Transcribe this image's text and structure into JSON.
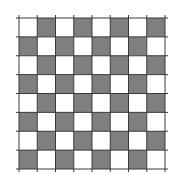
{
  "board": {
    "rows": 8,
    "cols": 8,
    "x0": 19,
    "y0": 18,
    "x1": 165,
    "y1": 169,
    "overhang": 3,
    "colors": {
      "dark": "#7f7f7f",
      "light": "#ffffff",
      "line": "#3a3a3a"
    },
    "pattern": [
      [
        0,
        1,
        0,
        1,
        0,
        1,
        0,
        1
      ],
      [
        1,
        0,
        1,
        0,
        1,
        0,
        1,
        0
      ],
      [
        0,
        1,
        0,
        1,
        0,
        1,
        0,
        1
      ],
      [
        1,
        0,
        1,
        0,
        1,
        0,
        1,
        0
      ],
      [
        0,
        1,
        0,
        1,
        0,
        1,
        0,
        1
      ],
      [
        1,
        0,
        1,
        0,
        1,
        0,
        1,
        0
      ],
      [
        0,
        1,
        0,
        1,
        0,
        1,
        0,
        1
      ],
      [
        1,
        0,
        1,
        0,
        1,
        0,
        1,
        0
      ]
    ]
  }
}
